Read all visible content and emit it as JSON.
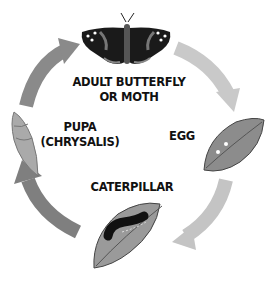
{
  "diagram": {
    "type": "cycle",
    "stages": [
      {
        "id": "adult",
        "label_line1": "ADULT BUTTERFLY",
        "label_line2": "OR MOTH",
        "icon": "butterfly-icon"
      },
      {
        "id": "egg",
        "label_line1": "EGG",
        "icon": "leaf-with-eggs-icon"
      },
      {
        "id": "caterpillar",
        "label_line1": "CATERPILLAR",
        "icon": "caterpillar-on-leaf-icon"
      },
      {
        "id": "pupa",
        "label_line1": "PUPA",
        "label_line2": "(CHRYSALIS)",
        "icon": "chrysalis-icon"
      }
    ],
    "arrows": [
      {
        "from": "adult",
        "to": "egg",
        "color": "#c8c8c8"
      },
      {
        "from": "egg",
        "to": "caterpillar",
        "color": "#c0c0c0"
      },
      {
        "from": "caterpillar",
        "to": "pupa",
        "color": "#808080"
      },
      {
        "from": "pupa",
        "to": "adult",
        "color": "#8c8c8c"
      }
    ]
  }
}
